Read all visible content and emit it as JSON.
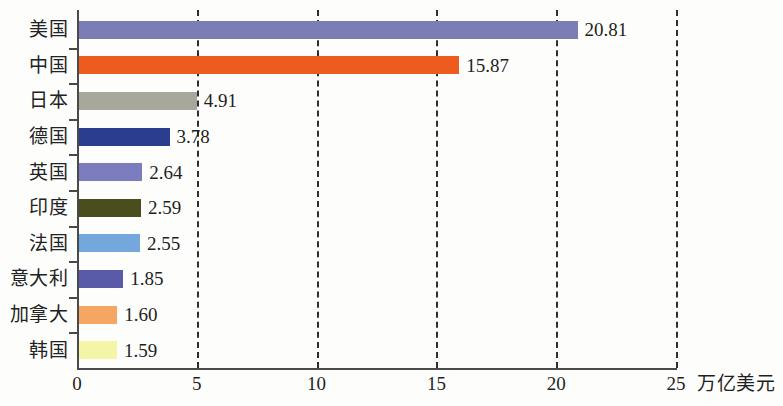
{
  "chart_data": {
    "type": "bar",
    "orientation": "horizontal",
    "title": "",
    "xlabel": "万亿美元",
    "ylabel": "",
    "xlim": [
      0,
      25
    ],
    "xticks": [
      0,
      5,
      10,
      15,
      20,
      25
    ],
    "xtick_labels": [
      "0",
      "5",
      "10",
      "15",
      "20",
      "25"
    ],
    "grid": "vertical-dashed",
    "legend": "none",
    "categories": [
      "美国",
      "中国",
      "日本",
      "德国",
      "英国",
      "印度",
      "法国",
      "意大利",
      "加拿大",
      "韩国"
    ],
    "values": [
      20.81,
      15.87,
      4.91,
      3.78,
      2.64,
      2.59,
      2.55,
      1.85,
      1.6,
      1.59
    ],
    "value_labels": [
      "20.81",
      "15.87",
      "4.91",
      "3.78",
      "2.64",
      "2.59",
      "2.55",
      "1.85",
      "1.60",
      "1.59"
    ],
    "colors": [
      "#7b7db5",
      "#ee5b1e",
      "#a8a79b",
      "#2b3d8f",
      "#7b7dbe",
      "#4a4d1e",
      "#74a8dd",
      "#5a5ba8",
      "#f5a662",
      "#f5f5a8"
    ],
    "bars": [
      {
        "category": "美国",
        "value": 20.81,
        "label": "20.81",
        "color": "#7b7db5"
      },
      {
        "category": "中国",
        "value": 15.87,
        "label": "15.87",
        "color": "#ee5b1e"
      },
      {
        "category": "日本",
        "value": 4.91,
        "label": "4.91",
        "color": "#a8a79b"
      },
      {
        "category": "德国",
        "value": 3.78,
        "label": "3.78",
        "color": "#2b3d8f"
      },
      {
        "category": "英国",
        "value": 2.64,
        "label": "2.64",
        "color": "#7b7dbe"
      },
      {
        "category": "印度",
        "value": 2.59,
        "label": "2.59",
        "color": "#4a4d1e"
      },
      {
        "category": "法国",
        "value": 2.55,
        "label": "2.55",
        "color": "#74a8dd"
      },
      {
        "category": "意大利",
        "value": 1.85,
        "label": "1.85",
        "color": "#5a5ba8"
      },
      {
        "category": "加拿大",
        "value": 1.6,
        "label": "1.60",
        "color": "#f5a662"
      },
      {
        "category": "韩国",
        "value": 1.59,
        "label": "1.59",
        "color": "#f5f5a8"
      }
    ]
  },
  "axis": {
    "unit_label": "万亿美元",
    "ticks": [
      {
        "label": "0",
        "value": 0
      },
      {
        "label": "5",
        "value": 5
      },
      {
        "label": "10",
        "value": 10
      },
      {
        "label": "15",
        "value": 15
      },
      {
        "label": "20",
        "value": 20
      },
      {
        "label": "25",
        "value": 25
      }
    ]
  }
}
